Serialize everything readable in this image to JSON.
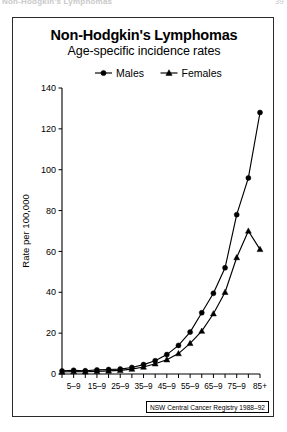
{
  "running_header": {
    "left": "Non-Hodgkin's Lymphomas",
    "right": "39"
  },
  "source_note": "NSW Central Cancer Registry 1988–92",
  "chart_data": {
    "type": "line",
    "title": "Non-Hodgkin's Lymphomas",
    "subtitle": "Age-specific incidence rates",
    "xlabel": "",
    "ylabel": "Rate per 100,000",
    "ylim": [
      0,
      140
    ],
    "yticks": [
      0,
      20,
      40,
      60,
      80,
      100,
      120,
      140
    ],
    "ytick_labels": [
      "0",
      "20",
      "40",
      "60",
      "80",
      "100",
      "120",
      "140"
    ],
    "grid": false,
    "legend_position": "top-center",
    "categories": [
      "0–4",
      "5–9",
      "10–4",
      "15–9",
      "20–4",
      "25–9",
      "30–4",
      "35–9",
      "40–4",
      "45–9",
      "50–4",
      "55–9",
      "60–4",
      "65–9",
      "70–4",
      "75–9",
      "80–4",
      "85+"
    ],
    "xtick_labels_shown": [
      "5–9",
      "15–9",
      "25–9",
      "35–9",
      "45–9",
      "55–9",
      "65–9",
      "75–9",
      "85+"
    ],
    "xtick_label_indices": [
      1,
      3,
      5,
      7,
      9,
      11,
      13,
      15,
      17
    ],
    "series": [
      {
        "name": "Males",
        "marker": "circle",
        "values": [
          1.5,
          1.8,
          1.6,
          2.0,
          2.2,
          2.4,
          3.2,
          4.6,
          6.5,
          9.5,
          14.0,
          20.5,
          30.0,
          39.5,
          52.0,
          78.0,
          96.0,
          128.0
        ]
      },
      {
        "name": "Females",
        "marker": "triangle",
        "values": [
          1.0,
          1.2,
          1.1,
          1.3,
          1.5,
          1.8,
          2.4,
          3.4,
          5.0,
          7.0,
          10.0,
          15.0,
          21.0,
          29.5,
          40.0,
          57.0,
          70.0,
          61.0
        ]
      }
    ],
    "extra_points": [
      {
        "series": "Females",
        "category": "80–4",
        "value": 69.5
      },
      {
        "series": "Males",
        "category": "80–4",
        "value": 106.0
      }
    ]
  },
  "legend": {
    "items": [
      {
        "label": "Males",
        "marker": "circle"
      },
      {
        "label": "Females",
        "marker": "triangle"
      }
    ]
  }
}
